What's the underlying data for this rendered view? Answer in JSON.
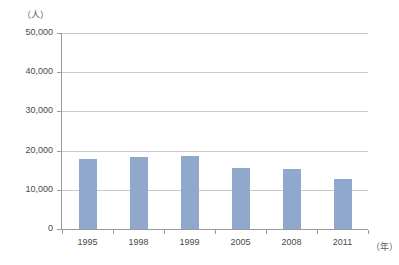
{
  "chart_data": {
    "type": "bar",
    "title": "",
    "subtitle": "",
    "categories": [
      "1995",
      "1998",
      "1999",
      "2005",
      "2008",
      "2011"
    ],
    "values": [
      17800,
      18300,
      18600,
      15600,
      15400,
      12700
    ],
    "xlabel": "（年）",
    "ylabel": "（人）",
    "ylim": [
      0,
      50000
    ],
    "ytick_labels": [
      "50,000",
      "40,000",
      "30,000",
      "20,000",
      "10,000",
      "0"
    ],
    "ytick_values": [
      50000,
      40000,
      30000,
      20000,
      10000,
      0
    ],
    "grid": true,
    "legend": false,
    "legend_position": "none",
    "bar_color": "#8fa8cc",
    "gridline_color": "#c9c9c9",
    "axis_color": "#9a9a9a",
    "text_color": "#4a4a4a",
    "background_color": "#ffffff"
  }
}
